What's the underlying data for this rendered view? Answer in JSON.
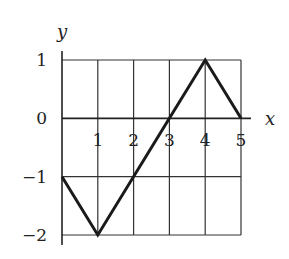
{
  "chart_data": {
    "type": "line",
    "title": "",
    "xlabel": "x",
    "ylabel": "y",
    "x": [
      0,
      1,
      2,
      3,
      4,
      5
    ],
    "series": [
      {
        "name": "f(x)",
        "values": [
          -1,
          -2,
          -1,
          0,
          1,
          0
        ]
      }
    ],
    "vertices": [
      [
        0,
        -1
      ],
      [
        1,
        -2
      ],
      [
        3,
        0
      ],
      [
        4,
        1
      ],
      [
        5,
        0
      ]
    ],
    "xlim": [
      0,
      5
    ],
    "ylim": [
      -2,
      1
    ],
    "x_ticks": [
      "1",
      "2",
      "3",
      "4",
      "5"
    ],
    "y_ticks": [
      "1",
      "0",
      "−1",
      "−2"
    ],
    "grid": true,
    "legend": null
  },
  "labels": {
    "x_axis": "x",
    "y_axis": "y"
  },
  "colors": {
    "line": "#1a1a1a",
    "grid": "#333333",
    "background": "#ffffff"
  }
}
